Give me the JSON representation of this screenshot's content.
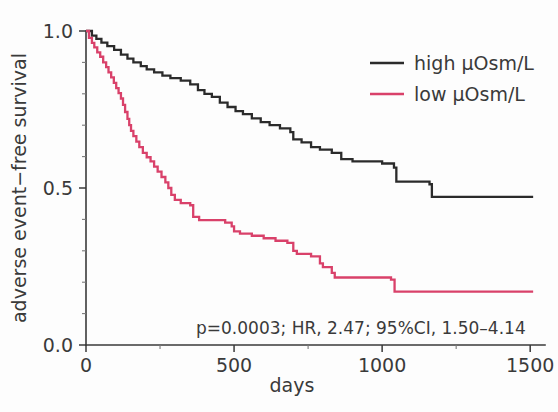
{
  "chart_data": {
    "type": "line",
    "subtype": "kaplan-meier-step",
    "title": "",
    "xlabel": "days",
    "ylabel": "adverse event−free survival",
    "xlim": [
      0,
      1550
    ],
    "ylim": [
      0.0,
      1.0
    ],
    "grid": false,
    "xticks": [
      0,
      500,
      1000,
      1500
    ],
    "xtick_labels": [
      "0",
      "500",
      "1000",
      "1500"
    ],
    "xminor_interval": 250,
    "yticks": [
      0.0,
      0.5,
      1.0
    ],
    "ytick_labels": [
      "0.0",
      "0.5",
      "1.0"
    ],
    "yminor_interval": 0.1,
    "legend_position": "top-right",
    "annotation": "p=0.0003; HR, 2.47; 95%CI, 1.50–4.14",
    "series": [
      {
        "name": "high μOsm/L",
        "color": "#2b2b2b",
        "legend_label": "high μOsm/L",
        "final_survival": 0.47,
        "steps": [
          [
            0,
            1.0
          ],
          [
            20,
            0.985
          ],
          [
            35,
            0.975
          ],
          [
            52,
            0.963
          ],
          [
            72,
            0.952
          ],
          [
            95,
            0.94
          ],
          [
            118,
            0.925
          ],
          [
            140,
            0.912
          ],
          [
            160,
            0.9
          ],
          [
            185,
            0.888
          ],
          [
            205,
            0.878
          ],
          [
            230,
            0.868
          ],
          [
            258,
            0.858
          ],
          [
            285,
            0.85
          ],
          [
            320,
            0.842
          ],
          [
            352,
            0.83
          ],
          [
            378,
            0.812
          ],
          [
            400,
            0.8
          ],
          [
            425,
            0.79
          ],
          [
            452,
            0.772
          ],
          [
            478,
            0.758
          ],
          [
            505,
            0.745
          ],
          [
            530,
            0.735
          ],
          [
            560,
            0.722
          ],
          [
            590,
            0.71
          ],
          [
            620,
            0.7
          ],
          [
            655,
            0.69
          ],
          [
            690,
            0.678
          ],
          [
            700,
            0.655
          ],
          [
            728,
            0.645
          ],
          [
            760,
            0.63
          ],
          [
            790,
            0.622
          ],
          [
            830,
            0.612
          ],
          [
            862,
            0.592
          ],
          [
            900,
            0.585
          ],
          [
            1000,
            0.578
          ],
          [
            1040,
            0.565
          ],
          [
            1048,
            0.52
          ],
          [
            1160,
            0.512
          ],
          [
            1168,
            0.472
          ],
          [
            1510,
            0.472
          ]
        ]
      },
      {
        "name": "low μOsm/L",
        "color": "#d9416a",
        "legend_label": "low μOsm/L",
        "final_survival": 0.17,
        "steps": [
          [
            0,
            1.0
          ],
          [
            10,
            0.978
          ],
          [
            20,
            0.962
          ],
          [
            28,
            0.948
          ],
          [
            38,
            0.932
          ],
          [
            48,
            0.918
          ],
          [
            58,
            0.9
          ],
          [
            68,
            0.885
          ],
          [
            76,
            0.868
          ],
          [
            85,
            0.852
          ],
          [
            94,
            0.835
          ],
          [
            102,
            0.818
          ],
          [
            110,
            0.802
          ],
          [
            118,
            0.785
          ],
          [
            125,
            0.765
          ],
          [
            132,
            0.742
          ],
          [
            140,
            0.72
          ],
          [
            146,
            0.7
          ],
          [
            152,
            0.682
          ],
          [
            160,
            0.665
          ],
          [
            170,
            0.648
          ],
          [
            180,
            0.63
          ],
          [
            192,
            0.612
          ],
          [
            205,
            0.598
          ],
          [
            218,
            0.585
          ],
          [
            230,
            0.568
          ],
          [
            242,
            0.552
          ],
          [
            255,
            0.535
          ],
          [
            268,
            0.518
          ],
          [
            278,
            0.5
          ],
          [
            288,
            0.478
          ],
          [
            300,
            0.462
          ],
          [
            320,
            0.452
          ],
          [
            352,
            0.445
          ],
          [
            362,
            0.408
          ],
          [
            382,
            0.398
          ],
          [
            470,
            0.39
          ],
          [
            492,
            0.378
          ],
          [
            500,
            0.362
          ],
          [
            520,
            0.355
          ],
          [
            560,
            0.348
          ],
          [
            600,
            0.34
          ],
          [
            640,
            0.332
          ],
          [
            680,
            0.325
          ],
          [
            700,
            0.3
          ],
          [
            712,
            0.29
          ],
          [
            760,
            0.282
          ],
          [
            790,
            0.26
          ],
          [
            800,
            0.248
          ],
          [
            830,
            0.23
          ],
          [
            840,
            0.215
          ],
          [
            1030,
            0.208
          ],
          [
            1042,
            0.17
          ],
          [
            1510,
            0.17
          ]
        ]
      }
    ]
  },
  "axes": {
    "y_title": "adverse event−free survival",
    "x_title": "days",
    "x_labels": [
      "0",
      "500",
      "1000",
      "1500"
    ],
    "y_labels": [
      "0.0",
      "0.5",
      "1.0"
    ]
  },
  "legend": {
    "entries": [
      {
        "label": "high μOsm/L",
        "color": "#2b2b2b"
      },
      {
        "label": "low μOsm/L",
        "color": "#d9416a"
      }
    ]
  },
  "stats": {
    "text": "p=0.0003; HR, 2.47; 95%CI, 1.50–4.14",
    "p_value": "0.0003",
    "hazard_ratio": "2.47",
    "ci_label": "95%CI",
    "ci_range": "1.50–4.14"
  },
  "colors": {
    "high_group": "#2b2b2b",
    "low_group": "#d9416a",
    "axis": "#3a3a3a",
    "background": "#fdfdfd"
  }
}
